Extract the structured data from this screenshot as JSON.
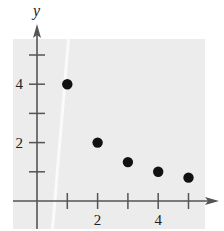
{
  "chart_data": {
    "type": "scatter",
    "title": "",
    "xlabel": "",
    "ylabel": "y",
    "x": [
      1,
      2,
      3,
      4,
      5
    ],
    "series": [
      {
        "name": "points",
        "values": [
          4,
          2,
          1.333,
          1,
          0.8
        ]
      }
    ],
    "xlim": [
      -0.8,
      5.6
    ],
    "ylim": [
      -0.9,
      5.8
    ],
    "x_ticks": [
      1,
      2,
      3,
      4,
      5
    ],
    "x_tick_labels": [
      {
        "value": 2,
        "label": "2"
      },
      {
        "value": 4,
        "label": "4"
      }
    ],
    "y_ticks": [
      1,
      2,
      3,
      4,
      5
    ],
    "y_tick_labels": [
      {
        "value": 2,
        "label": "2"
      },
      {
        "value": 4,
        "label": "4"
      }
    ],
    "grid": false,
    "legend": null
  },
  "style": {
    "panel_color": "#ececec",
    "axis_color": "#555555",
    "point_color": "#111111",
    "stripe_color": "#fafafa"
  }
}
